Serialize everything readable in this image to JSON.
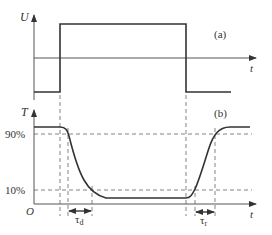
{
  "diagram": {
    "panel_a": {
      "label": "(a)",
      "y_axis_label": "U",
      "x_axis_label": "t"
    },
    "panel_b": {
      "label": "(b)",
      "y_axis_label": "T",
      "x_axis_label": "t",
      "origin_label": "O",
      "level_90": "90%",
      "level_10": "10%",
      "delay_label": "τ",
      "delay_sub": "d",
      "rise_label": "τ",
      "rise_sub": "r"
    },
    "colors": {
      "line": "#333333",
      "dashed": "#666666",
      "axis": "#555555"
    }
  }
}
